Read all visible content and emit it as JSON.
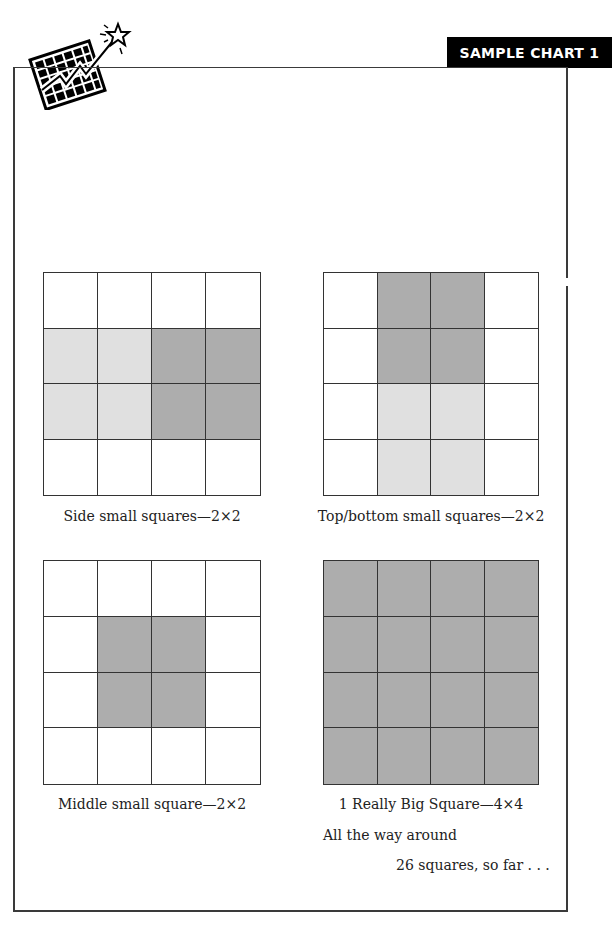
{
  "header": {
    "title": "SAMPLE CHART 1"
  },
  "logo": {
    "icon": "chart-star-icon",
    "description": "tilted grid chart with zigzag arrow and star"
  },
  "colors": {
    "light_shade": "#e0e0e0",
    "dark_shade": "#adadad",
    "grid_line": "#333333",
    "header_bg": "#000000",
    "header_text": "#ffffff"
  },
  "grids": [
    {
      "id": "side-small-squares",
      "caption": "Side small squares—2×2",
      "cells": [
        [
          "w",
          "w",
          "w",
          "w"
        ],
        [
          "l",
          "l",
          "d",
          "d"
        ],
        [
          "l",
          "l",
          "d",
          "d"
        ],
        [
          "w",
          "w",
          "w",
          "w"
        ]
      ]
    },
    {
      "id": "top-bottom-small-squares",
      "caption": "Top/bottom small squares—2×2",
      "cells": [
        [
          "w",
          "d",
          "d",
          "w"
        ],
        [
          "w",
          "d",
          "d",
          "w"
        ],
        [
          "w",
          "l",
          "l",
          "w"
        ],
        [
          "w",
          "l",
          "l",
          "w"
        ]
      ]
    },
    {
      "id": "middle-small-square",
      "caption": "Middle small square—2×2",
      "cells": [
        [
          "w",
          "w",
          "w",
          "w"
        ],
        [
          "w",
          "d",
          "d",
          "w"
        ],
        [
          "w",
          "d",
          "d",
          "w"
        ],
        [
          "w",
          "w",
          "w",
          "w"
        ]
      ]
    },
    {
      "id": "really-big-square",
      "caption": "1 Really Big Square—4×4",
      "cells": [
        [
          "d",
          "d",
          "d",
          "d"
        ],
        [
          "d",
          "d",
          "d",
          "d"
        ],
        [
          "d",
          "d",
          "d",
          "d"
        ],
        [
          "d",
          "d",
          "d",
          "d"
        ]
      ]
    }
  ],
  "notes": {
    "line1": "All the way around",
    "line2": "26 squares, so far . . ."
  }
}
